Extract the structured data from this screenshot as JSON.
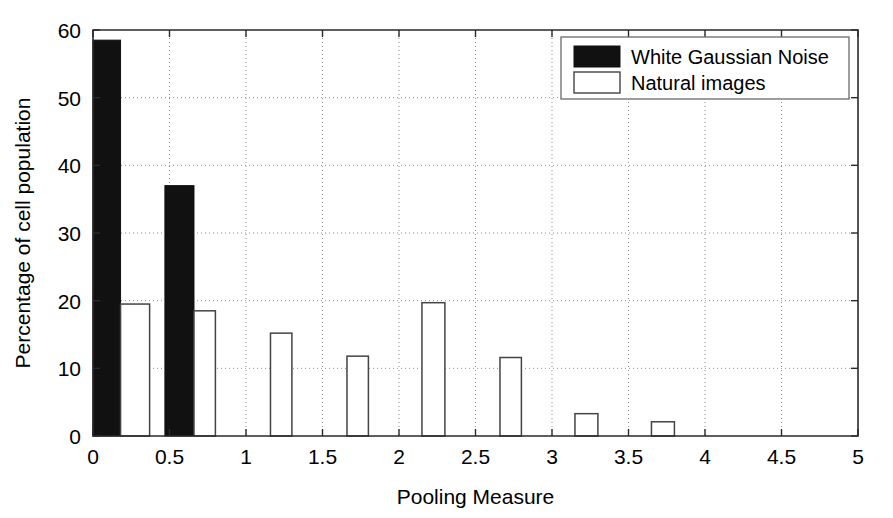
{
  "chart_data": {
    "type": "bar",
    "title": "",
    "subtitle": "",
    "xlabel": "Pooling Measure",
    "ylabel": "Percentage of cell population",
    "xlim": [
      0,
      5
    ],
    "ylim": [
      0,
      60
    ],
    "xticks": [
      0,
      0.5,
      1,
      1.5,
      2,
      2.5,
      3,
      3.5,
      4,
      4.5,
      5
    ],
    "xtick_labels": [
      "0",
      "0.5",
      "1",
      "1.5",
      "2",
      "2.5",
      "3",
      "3.5",
      "4",
      "4.5",
      "5"
    ],
    "yticks": [
      0,
      10,
      20,
      30,
      40,
      50,
      60
    ],
    "ytick_labels": [
      "0",
      "10",
      "20",
      "30",
      "40",
      "50",
      "60"
    ],
    "grid": true,
    "grid_style": "dotted",
    "legend_position": "top-right",
    "bar_style": "histogram-pairs",
    "series": [
      {
        "name": "White Gaussian Noise",
        "fill": "#111111",
        "edge": "#111111",
        "filled": true,
        "bars": [
          {
            "x_start": 0.0,
            "x_end": 0.18,
            "value": 58.5
          },
          {
            "x_start": 0.47,
            "x_end": 0.66,
            "value": 37.0
          }
        ]
      },
      {
        "name": "Natural images",
        "fill": "#ffffff",
        "edge": "#444444",
        "filled": false,
        "bars": [
          {
            "x_start": 0.18,
            "x_end": 0.37,
            "value": 19.5
          },
          {
            "x_start": 0.66,
            "x_end": 0.8,
            "value": 18.5
          },
          {
            "x_start": 1.16,
            "x_end": 1.3,
            "value": 15.2
          },
          {
            "x_start": 1.66,
            "x_end": 1.8,
            "value": 11.8
          },
          {
            "x_start": 2.15,
            "x_end": 2.3,
            "value": 19.7
          },
          {
            "x_start": 2.66,
            "x_end": 2.8,
            "value": 11.6
          },
          {
            "x_start": 3.15,
            "x_end": 3.3,
            "value": 3.3
          },
          {
            "x_start": 3.65,
            "x_end": 3.8,
            "value": 2.1
          }
        ]
      }
    ],
    "legend": [
      {
        "label": "White Gaussian Noise",
        "swatch": "filled"
      },
      {
        "label": "Natural images",
        "swatch": "open"
      }
    ]
  }
}
